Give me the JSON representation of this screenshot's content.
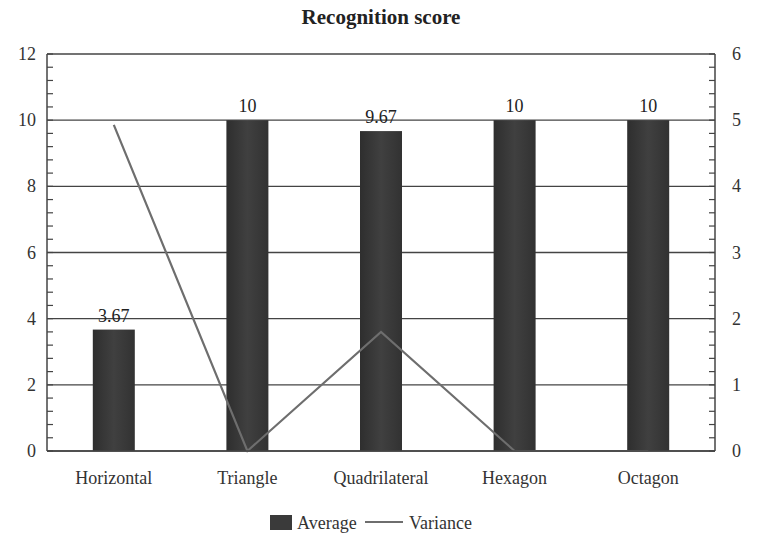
{
  "chart_data": {
    "type": "bar",
    "title": "Recognition score",
    "categories": [
      "Horizontal",
      "Triangle",
      "Quadrilateral",
      "Hexagon",
      "Octagon"
    ],
    "series": [
      {
        "name": "Average",
        "type": "bar",
        "axis": "left",
        "values": [
          3.67,
          10,
          9.67,
          10,
          10
        ],
        "labels": [
          "3.67",
          "10",
          "9.67",
          "10",
          "10"
        ],
        "color": "#3a3a3a"
      },
      {
        "name": "Variance",
        "type": "line",
        "axis": "right",
        "values": [
          4.93,
          0,
          1.8,
          0,
          0
        ],
        "color": "#6e6e6e"
      }
    ],
    "xlabel": "",
    "ylabel": "",
    "ylim": [
      0,
      12
    ],
    "y_ticks": [
      "0",
      "2",
      "4",
      "6",
      "8",
      "10",
      "12"
    ],
    "y2lim": [
      0,
      6
    ],
    "y2_ticks": [
      "0",
      "1",
      "2",
      "3",
      "4",
      "5",
      "6"
    ],
    "grid": true,
    "legend_position": "bottom",
    "legend": [
      "Average",
      "Variance"
    ]
  }
}
